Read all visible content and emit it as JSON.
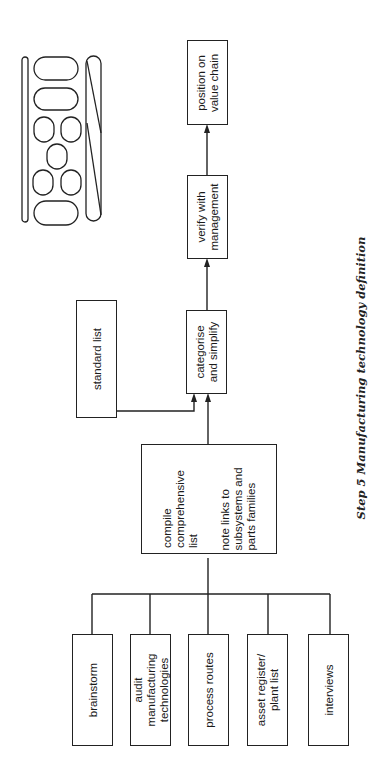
{
  "page": {
    "header_fragment": "(cropped running header, illegible)"
  },
  "diagram": {
    "title": "Step 5 Manufacturing technology definition",
    "inputs": [
      {
        "label": "brainstorm"
      },
      {
        "label": "audit manufacturing technologies"
      },
      {
        "label": "process routes"
      },
      {
        "label": "asset register/ plant list"
      },
      {
        "label": "interviews"
      }
    ],
    "compile_box": {
      "line1": "compile",
      "line2": "comprehensive",
      "line3": "list",
      "note1": "note links to",
      "note2": "subsystems and",
      "note3": "parts families"
    },
    "standard_list": {
      "label": "standard list"
    },
    "categorise": {
      "line1": "categorise",
      "line2": "and simplify"
    },
    "verify": {
      "line1": "verify with",
      "line2": "management"
    },
    "position": {
      "line1": "position on",
      "line2": "value chain"
    },
    "icon": "manufacturing-layout-icon",
    "colors": {
      "line": "#222222",
      "background": "#ffffff"
    }
  }
}
